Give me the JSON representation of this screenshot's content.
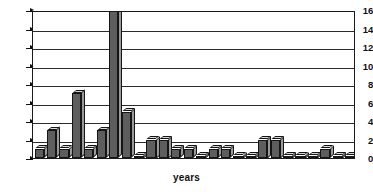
{
  "chart_data": {
    "type": "bar",
    "title": "",
    "subtitle": "",
    "xlabel": "years",
    "ylabel": "",
    "ylim": [
      0,
      16
    ],
    "yticks": [
      0,
      2,
      4,
      6,
      8,
      10,
      12,
      14,
      16
    ],
    "grid": true,
    "legend": null,
    "style": "3d-column",
    "categories": [
      "1",
      "2",
      "3",
      "4",
      "5",
      "6",
      "7",
      "8",
      "9",
      "10",
      "11",
      "12",
      "13",
      "14",
      "15",
      "16",
      "17",
      "18",
      "19",
      "20",
      "21",
      "22",
      "23",
      "24",
      "25",
      "26"
    ],
    "values": [
      1,
      3,
      1,
      7,
      1,
      3,
      16,
      5,
      0,
      2,
      2,
      1,
      1,
      0,
      1,
      1,
      0,
      0,
      2,
      2,
      0,
      0,
      0,
      1,
      0,
      0
    ],
    "series": [
      {
        "name": "count",
        "values": [
          1,
          3,
          1,
          7,
          1,
          3,
          16,
          5,
          0,
          2,
          2,
          1,
          1,
          0,
          1,
          1,
          0,
          0,
          2,
          2,
          0,
          0,
          0,
          1,
          0,
          0
        ]
      }
    ],
    "colors": {
      "bar_front": "#5e5e5e",
      "bar_top": "#d8d8d8",
      "bar_side": "#9a9a9a",
      "axis": "#111111",
      "grid": "#2b2b2b",
      "background": "#ffffff"
    }
  }
}
